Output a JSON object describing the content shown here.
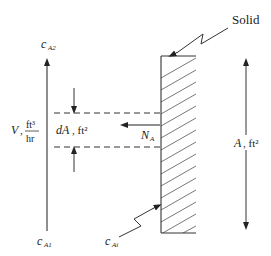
{
  "diagram": {
    "labels": {
      "solid": "Solid",
      "c_top": "c",
      "c_top_sub": "A2",
      "c_bottom": "c",
      "c_bottom_sub": "A1",
      "c_interface": "c",
      "c_interface_sub": "Ai",
      "flow_var": "V",
      "flow_units_num": "ft³",
      "flow_units_den": "hr",
      "dA": "dA",
      "dA_units": ", ft²",
      "flux": "N",
      "flux_sub": "A",
      "area": "A",
      "area_units": ", ft²"
    },
    "colors": {
      "line": "#333333",
      "hatch": "#444444"
    }
  }
}
